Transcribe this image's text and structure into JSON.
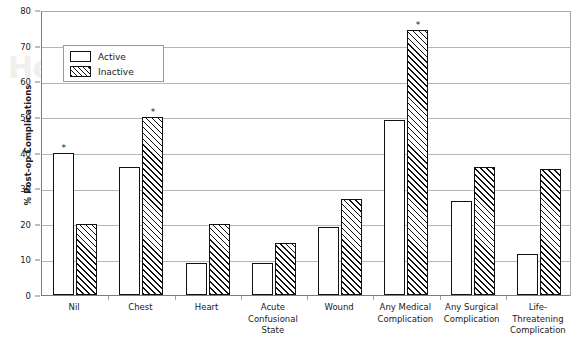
{
  "chart_data": {
    "type": "bar",
    "title": "",
    "xlabel": "",
    "ylabel": "% Post-op Complications",
    "ylim": [
      0,
      80
    ],
    "ytick_values": [
      0,
      10,
      20,
      30,
      40,
      50,
      60,
      70,
      80
    ],
    "ytick_labels": [
      "0",
      "10",
      "20",
      "30",
      "40",
      "50",
      "60",
      "70",
      "80"
    ],
    "grid": true,
    "legend_position": "upper-left-inside",
    "categories": [
      "Nil",
      "Chest",
      "Heart",
      "Acute Confusional State",
      "Wound",
      "Any Medical Complication",
      "Any Surgical Complication",
      "Life-Threatening Complication"
    ],
    "category_label_lines": [
      [
        "Nil"
      ],
      [
        "Chest"
      ],
      [
        "Heart"
      ],
      [
        "Acute",
        "Confusional",
        "State"
      ],
      [
        "Wound"
      ],
      [
        "Any Medical",
        "Complication"
      ],
      [
        "Any Surgical",
        "Complication"
      ],
      [
        "Life-",
        "Threatening",
        "Complication"
      ]
    ],
    "series": [
      {
        "name": "Active",
        "fill": "white",
        "values": [
          40,
          36,
          9,
          9,
          19,
          49,
          26.5,
          11.5
        ],
        "significance": [
          true,
          false,
          false,
          false,
          false,
          false,
          false,
          false
        ]
      },
      {
        "name": "Inactive",
        "fill": "hatched",
        "values": [
          20,
          50,
          20,
          14.5,
          27,
          74.5,
          36,
          35.5
        ],
        "significance": [
          false,
          true,
          false,
          false,
          false,
          true,
          false,
          false
        ]
      }
    ],
    "annotations": {
      "significance_marker": "*",
      "significance_note": "Asterisk marks statistically significant bars"
    }
  },
  "legend": {
    "items": [
      {
        "label": "Active",
        "swatch": "white-box"
      },
      {
        "label": "Inactive",
        "swatch": "hatched-box"
      }
    ]
  },
  "watermark": {
    "line1": "Health Technology",
    "line2": "Assessment"
  },
  "colors": {
    "bar_outline": "#111111",
    "bar_fill": "#ffffff",
    "gridline": "#b6b6b6",
    "axis": "#7d7d7d",
    "text": "#1a1a1a"
  }
}
